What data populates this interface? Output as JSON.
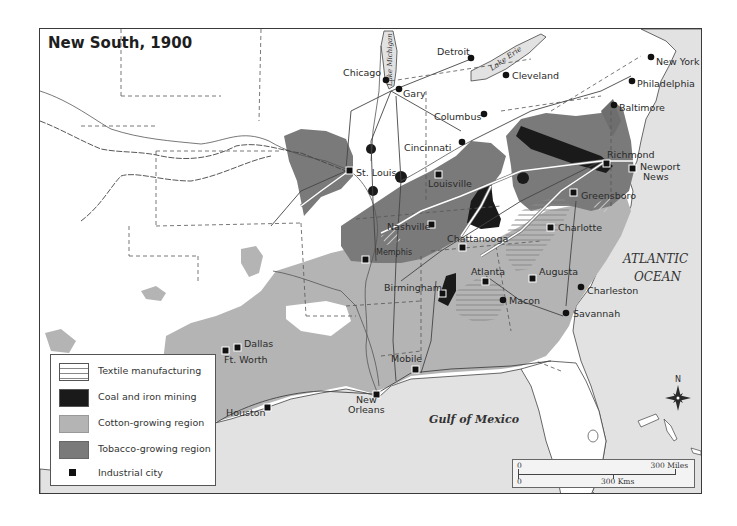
{
  "map": {
    "title": "New South, 1900",
    "colors": {
      "water": "#e2e2e2",
      "land": "#ffffff",
      "cotton": "#b4b4b4",
      "tobacco": "#7a7a7a",
      "coal_iron": "#1a1a1a",
      "textile_hatch": "#8a8a8a",
      "border": "#3a3a3a"
    },
    "water_labels": {
      "lake_michigan": "Lake Michigan",
      "lake_erie": "Lake Erie",
      "atlantic_1": "ATLANTIC",
      "atlantic_2": "OCEAN",
      "gulf": "Gulf of Mexico"
    },
    "cities": [
      {
        "name": "Chicago",
        "type": "city"
      },
      {
        "name": "Gary",
        "type": "city"
      },
      {
        "name": "Detroit",
        "type": "city"
      },
      {
        "name": "Cleveland",
        "type": "city"
      },
      {
        "name": "New York",
        "type": "city"
      },
      {
        "name": "Philadelphia",
        "type": "city"
      },
      {
        "name": "Baltimore",
        "type": "city"
      },
      {
        "name": "Columbus",
        "type": "city"
      },
      {
        "name": "Cincinnati",
        "type": "city"
      },
      {
        "name": "St. Louis",
        "type": "industrial"
      },
      {
        "name": "Louisville",
        "type": "industrial"
      },
      {
        "name": "Richmond",
        "type": "industrial"
      },
      {
        "name": "Newport",
        "type": "industrial"
      },
      {
        "name": "News",
        "type": "label-line"
      },
      {
        "name": "Greensboro",
        "type": "industrial"
      },
      {
        "name": "Nashville",
        "type": "industrial"
      },
      {
        "name": "Charlotte",
        "type": "industrial"
      },
      {
        "name": "Chattanooga",
        "type": "industrial"
      },
      {
        "name": "Memphis",
        "type": "industrial"
      },
      {
        "name": "Atlanta",
        "type": "industrial"
      },
      {
        "name": "Augusta",
        "type": "industrial"
      },
      {
        "name": "Birmingham",
        "type": "industrial"
      },
      {
        "name": "Macon",
        "type": "city"
      },
      {
        "name": "Charleston",
        "type": "city"
      },
      {
        "name": "Savannah",
        "type": "city"
      },
      {
        "name": "Dallas",
        "type": "industrial"
      },
      {
        "name": "Ft. Worth",
        "type": "industrial"
      },
      {
        "name": "Mobile",
        "type": "industrial"
      },
      {
        "name": "New",
        "type": "industrial"
      },
      {
        "name": "Orleans",
        "type": "label-line"
      },
      {
        "name": "Houston",
        "type": "industrial"
      }
    ],
    "compass": {
      "north_label": "N"
    },
    "scale_bar": {
      "miles_start": "0",
      "miles_end": "300 Miles",
      "km_start": "0",
      "km_end": "300 Kms"
    }
  },
  "legend": {
    "items": [
      {
        "label": "Textile manufacturing",
        "symbol": "horizontal-hatch"
      },
      {
        "label": "Coal and iron mining",
        "symbol": "black-fill"
      },
      {
        "label": "Cotton-growing region",
        "symbol": "light-gray-fill"
      },
      {
        "label": "Tobacco-growing region",
        "symbol": "dark-gray-fill"
      },
      {
        "label": "Industrial city",
        "symbol": "black-square"
      }
    ]
  }
}
